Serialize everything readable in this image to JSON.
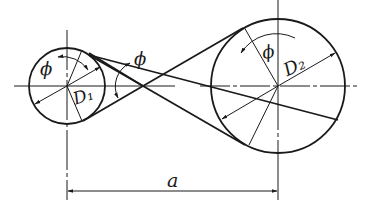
{
  "diagram": {
    "labels": {
      "small_pulley_diameter": "D₁",
      "large_pulley_diameter": "D₂",
      "wrap_angle_small": "ϕ",
      "cross_angle": "ϕ",
      "wrap_angle_large": "ϕ",
      "center_distance": "a"
    },
    "pulleys": [
      {
        "name": "small",
        "cx": 67,
        "cy": 86,
        "r": 38
      },
      {
        "name": "large",
        "cx": 278,
        "cy": 86,
        "r": 67
      }
    ],
    "crossing_point": {
      "x": 143,
      "y": 86
    },
    "colors": {
      "line": "#1a1a1a",
      "background": "#ffffff"
    }
  }
}
